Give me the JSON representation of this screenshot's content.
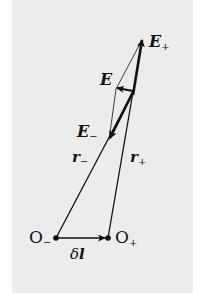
{
  "diagram": {
    "background_color": "#ececec",
    "line_color": "#111111",
    "labels": {
      "E_plus": {
        "main": "E",
        "sub": "+"
      },
      "E": {
        "main": "E"
      },
      "E_minus": {
        "main": "E",
        "sub": "−"
      },
      "r_minus": {
        "main": "r",
        "sub": "−"
      },
      "r_plus": {
        "main": "r",
        "sub": "+"
      },
      "O_minus": {
        "main": "O",
        "sub": "−"
      },
      "O_plus": {
        "main": "O",
        "sub": "+"
      },
      "delta_l": {
        "main": "δ",
        "bold": "l"
      }
    },
    "points": {
      "O_minus": [
        56,
        238
      ],
      "O_plus": [
        108,
        238
      ],
      "field_point": [
        133,
        92
      ],
      "E_plus_tip": [
        142,
        38
      ],
      "E_minus_tip": [
        112,
        137
      ],
      "E_tip": [
        116,
        88
      ]
    }
  }
}
